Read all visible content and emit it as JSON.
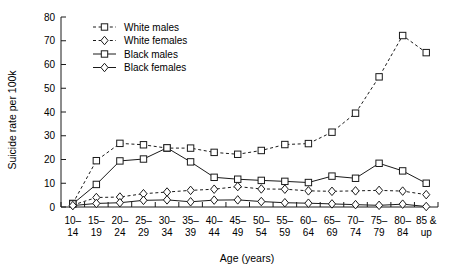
{
  "chart_data": {
    "type": "line",
    "title": "",
    "xlabel": "Age (years)",
    "ylabel": "Suicide rate per 100k",
    "ylim": [
      0,
      80
    ],
    "yticks": [
      0,
      10,
      20,
      30,
      40,
      50,
      60,
      70,
      80
    ],
    "grid": false,
    "legend_position": "top-left inside plot",
    "categories": [
      "10-14",
      "15-19",
      "20-24",
      "25-29",
      "30-34",
      "35-39",
      "40-44",
      "45-49",
      "50-54",
      "55-59",
      "60-64",
      "65-69",
      "70-74",
      "75-79",
      "80-84",
      "85 & up"
    ],
    "category_lines": [
      [
        "10–",
        "14"
      ],
      [
        "15–",
        "19"
      ],
      [
        "20–",
        "24"
      ],
      [
        "25–",
        "29"
      ],
      [
        "30–",
        "34"
      ],
      [
        "35–",
        "39"
      ],
      [
        "40–",
        "44"
      ],
      [
        "45–",
        "49"
      ],
      [
        "50–",
        "54"
      ],
      [
        "55–",
        "59"
      ],
      [
        "60–",
        "64"
      ],
      [
        "65–",
        "69"
      ],
      [
        "70–",
        "74"
      ],
      [
        "75–",
        "79"
      ],
      [
        "80–",
        "84"
      ],
      [
        "85 &",
        "up"
      ]
    ],
    "series": [
      {
        "name": "White males",
        "style": "dashed",
        "marker": "square",
        "values": [
          1.5,
          19.5,
          26.8,
          26.2,
          24.8,
          24.8,
          23.0,
          22.2,
          23.8,
          26.3,
          26.7,
          31.5,
          39.5,
          54.8,
          72.2,
          65.0
        ]
      },
      {
        "name": "White females",
        "style": "dashed",
        "marker": "diamond",
        "values": [
          0.8,
          4.0,
          4.2,
          5.6,
          6.3,
          7.0,
          7.5,
          8.6,
          7.6,
          7.5,
          6.8,
          6.6,
          6.8,
          7.0,
          6.7,
          5.2
        ]
      },
      {
        "name": "Black males",
        "style": "solid",
        "marker": "square",
        "values": [
          1.3,
          9.5,
          19.4,
          20.2,
          24.9,
          19.0,
          12.5,
          11.7,
          11.2,
          10.8,
          10.3,
          13.0,
          12.1,
          18.4,
          15.2,
          10.0
        ]
      },
      {
        "name": "Black females",
        "style": "solid",
        "marker": "diamond",
        "values": [
          0.6,
          1.5,
          1.8,
          2.8,
          3.0,
          2.2,
          2.9,
          3.0,
          2.3,
          1.8,
          1.6,
          1.3,
          1.0,
          0.7,
          1.2,
          0.2
        ]
      }
    ],
    "colors": {
      "ink": "#1a1a1a",
      "background": "#ffffff"
    }
  },
  "legend": {
    "items": [
      {
        "label": "White males"
      },
      {
        "label": "White females"
      },
      {
        "label": "Black males"
      },
      {
        "label": "Black females"
      }
    ]
  }
}
